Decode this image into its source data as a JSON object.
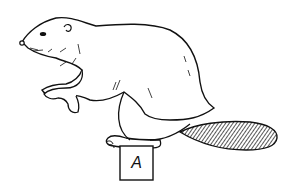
{
  "illustration": {
    "subject": "beaver",
    "style": "black ink line drawing",
    "box_label": "A",
    "colors": {
      "ink": "#111111",
      "background": "#ffffff"
    }
  }
}
